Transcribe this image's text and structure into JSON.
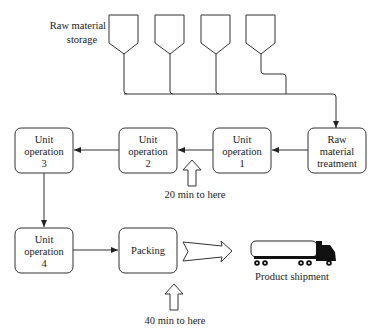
{
  "diagram": {
    "type": "process-flow",
    "storage_label": [
      "Raw material",
      "storage"
    ],
    "hoppers": [
      {
        "id": "hopper-1"
      },
      {
        "id": "hopper-2"
      },
      {
        "id": "hopper-3"
      },
      {
        "id": "hopper-4"
      }
    ],
    "nodes": {
      "raw_treatment": [
        "Raw",
        "material",
        "treatment"
      ],
      "unit_op_1": [
        "Unit",
        "operation",
        "1"
      ],
      "unit_op_2": [
        "Unit",
        "operation",
        "2"
      ],
      "unit_op_3": [
        "Unit",
        "operation",
        "3"
      ],
      "unit_op_4": [
        "Unit",
        "operation",
        "4"
      ],
      "packing": [
        "Packing"
      ]
    },
    "annotations": {
      "marker_1": "20 min to here",
      "marker_2": "40 min to here"
    },
    "shipment_label": "Product shipment",
    "edges": [
      {
        "from": "raw_material_storage",
        "to": "raw_treatment"
      },
      {
        "from": "raw_treatment",
        "to": "unit_op_1"
      },
      {
        "from": "unit_op_1",
        "to": "unit_op_2"
      },
      {
        "from": "unit_op_2",
        "to": "unit_op_3"
      },
      {
        "from": "unit_op_3",
        "to": "unit_op_4"
      },
      {
        "from": "unit_op_4",
        "to": "packing"
      },
      {
        "from": "packing",
        "to": "product_shipment"
      }
    ],
    "colors": {
      "stroke": "#333333",
      "fill": "#ffffff",
      "truck": "#111111"
    }
  }
}
